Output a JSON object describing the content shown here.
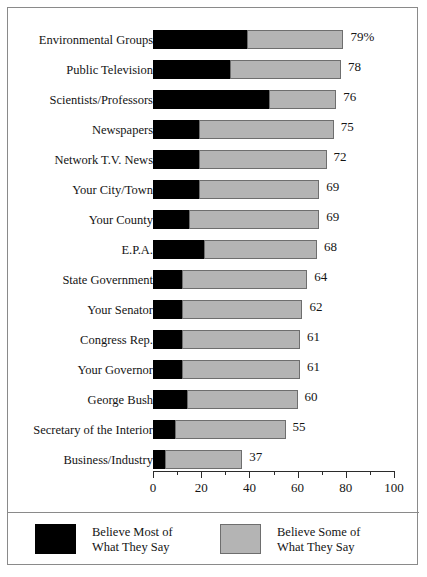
{
  "chart_data": {
    "type": "bar",
    "orientation": "horizontal",
    "stacked": true,
    "title": "",
    "subtitle": "",
    "xlabel": "",
    "ylabel": "",
    "xlim": [
      0,
      100
    ],
    "xticks": [
      0,
      20,
      40,
      60,
      80,
      100
    ],
    "xtick_labels": [
      "0",
      "20",
      "40",
      "60",
      "80",
      "100"
    ],
    "xminor_ticks": [
      10,
      30,
      50,
      70,
      90
    ],
    "grid": false,
    "legend_position": "bottom",
    "categories": [
      "Environmental Groups",
      "Public Television",
      "Scientists/Professors",
      "Newspapers",
      "Network T.V. News",
      "Your City/Town",
      "Your County",
      "E.P.A.",
      "State Government",
      "Your Senator",
      "Congress Rep.",
      "Your Governor",
      "George Bush",
      "Secretary of the Interior",
      "Business/Industry"
    ],
    "series": [
      {
        "name": "Believe Most of What They Say",
        "color": "#000000",
        "values": [
          39,
          32,
          48,
          19,
          19,
          19,
          15,
          21,
          12,
          12,
          12,
          12,
          14,
          9,
          5
        ]
      },
      {
        "name": "Believe Some of What They Say",
        "color": "#b4b4b4",
        "values": [
          40,
          46,
          28,
          56,
          53,
          50,
          54,
          47,
          52,
          50,
          49,
          49,
          46,
          46,
          32
        ]
      }
    ],
    "totals": [
      79,
      78,
      76,
      75,
      72,
      69,
      69,
      68,
      64,
      62,
      61,
      61,
      60,
      55,
      37
    ],
    "total_labels": [
      "79%",
      "78",
      "76",
      "75",
      "72",
      "69",
      "69",
      "68",
      "64",
      "62",
      "61",
      "61",
      "60",
      "55",
      "37"
    ]
  },
  "legend": {
    "items": [
      {
        "swatch": "black-swatch",
        "line1": "Believe Most of",
        "line2": "What They Say"
      },
      {
        "swatch": "gray-swatch",
        "line1": "Believe Some of",
        "line2": "What They Say"
      }
    ]
  }
}
